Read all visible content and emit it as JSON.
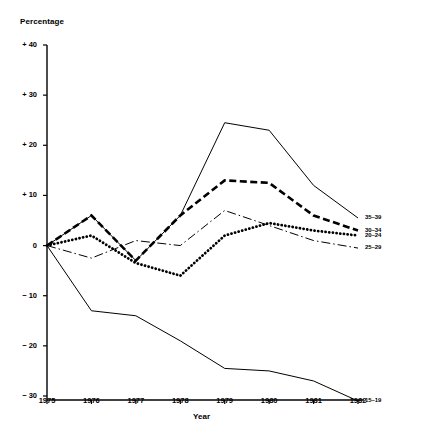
{
  "chart_data": {
    "type": "line",
    "title": "",
    "xlabel": "Year",
    "ylabel": "Percentage",
    "x": [
      1975,
      1976,
      1977,
      1978,
      1979,
      1980,
      1981,
      1982
    ],
    "xtick_labels": [
      "1975",
      "1976",
      "1977",
      "1978",
      "1979",
      "1980",
      "1981",
      "1982"
    ],
    "ytick_labels": [
      "+ 40",
      "+ 30",
      "+ 20",
      "+ 10",
      "0",
      "− 10",
      "− 20",
      "− 30"
    ],
    "ytick_values": [
      40,
      30,
      20,
      10,
      0,
      -10,
      -20,
      -30
    ],
    "ylim": [
      -33,
      40
    ],
    "xlim": [
      1975,
      1982
    ],
    "grid": false,
    "legend_position": "right-inline-end-of-line",
    "series": [
      {
        "name": "35–39",
        "label": "35–39",
        "style": "solid-thin",
        "values": [
          0,
          6,
          -3,
          6,
          24.5,
          23,
          12,
          5.5
        ]
      },
      {
        "name": "30–34",
        "label": "30–34",
        "style": "dashed-thick",
        "values": [
          0,
          6,
          -3,
          6,
          13,
          12.5,
          6,
          3
        ]
      },
      {
        "name": "20–24",
        "label": "20–24",
        "style": "dotted-thick",
        "values": [
          0,
          2,
          -3.5,
          -6,
          2,
          4.5,
          3,
          2
        ]
      },
      {
        "name": "25–29",
        "label": "25–29",
        "style": "dash-dot-thin",
        "values": [
          0,
          -2.5,
          1,
          0,
          7,
          4,
          1,
          -0.5
        ]
      },
      {
        "name": "15–19",
        "label": "15–19",
        "style": "solid-thin",
        "values": [
          0,
          -13,
          -14,
          -19,
          -24.5,
          -25,
          -27,
          -31
        ]
      }
    ]
  },
  "axes": {
    "y_title": "Percentage",
    "x_title": "Year"
  },
  "colors": {
    "line": "#000000",
    "axis": "#000000",
    "background": "#ffffff"
  }
}
